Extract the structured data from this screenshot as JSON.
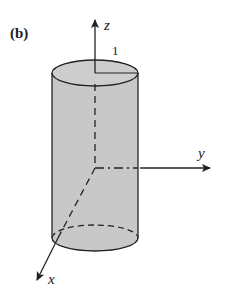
{
  "figure": {
    "panel_label": "(b)",
    "shape": "cylinder",
    "radius_label": "1",
    "axes": {
      "x": "x",
      "y": "y",
      "z": "z"
    },
    "colors": {
      "fill": "#c8c8c8",
      "stroke": "#222222",
      "background": "#ffffff"
    }
  }
}
